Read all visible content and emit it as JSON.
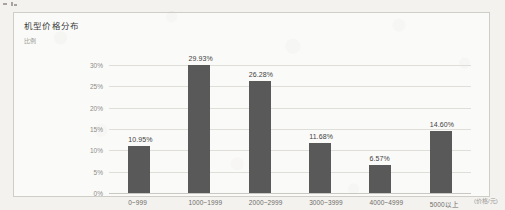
{
  "chart_data": {
    "type": "bar",
    "title": "机型价格分布",
    "xlabel": "(价格/元)",
    "ylabel": "比例",
    "categories": [
      "0~999",
      "1000~1999",
      "2000~2999",
      "3000~3999",
      "4000~4999",
      "5000以上"
    ],
    "values": [
      10.95,
      29.93,
      26.28,
      11.68,
      6.57,
      14.6
    ],
    "value_labels": [
      "10.95%",
      "29.93%",
      "26.28%",
      "11.68%",
      "6.57%",
      "14.60%"
    ],
    "ylim": [
      0,
      30
    ],
    "yticks": [
      0,
      5,
      10,
      15,
      20,
      25,
      30
    ],
    "ytick_labels": [
      "0%",
      "5%",
      "10%",
      "15%",
      "20%",
      "25%",
      "30%"
    ],
    "grid": true,
    "legend": false,
    "bar_color": "#595959",
    "gridline_color": "#e0ded9"
  }
}
